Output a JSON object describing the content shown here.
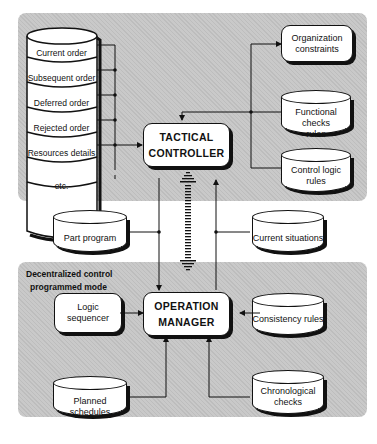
{
  "diagram": {
    "top_panel": {
      "stack_items": [
        "Current order",
        "Subsequent order",
        "Deferred order",
        "Rejected order",
        "Resources details",
        "etc."
      ],
      "tactical_controller": {
        "line1": "TACTICAL",
        "line2": "CONTROLLER"
      },
      "right_items": {
        "organization_constraints": {
          "line1": "Organization",
          "line2": "constraints"
        },
        "functional_checks_rules": {
          "line1": "Functional checks",
          "line2": "rules"
        },
        "control_logic_rules": {
          "line1": "Control  logic",
          "line2": "rules"
        }
      }
    },
    "middle": {
      "part_program": "Part program",
      "current_situations": "Current situations"
    },
    "bottom_panel": {
      "label_line1": "Decentralized control",
      "label_line2": "programmed mode",
      "operation_manager": {
        "line1": "OPERATION",
        "line2": "MANAGER"
      },
      "logic_sequencer": {
        "line1": "Logic",
        "line2": "sequencer"
      },
      "consistency_rules": "Consistency  rules",
      "planned_schedules": "Planned schedules",
      "chronological_checks": {
        "line1": "Chronological",
        "line2": "checks"
      }
    },
    "colors": {
      "panel": "#c9c9c9",
      "box": "#ffffff",
      "stroke": "#111111"
    }
  }
}
